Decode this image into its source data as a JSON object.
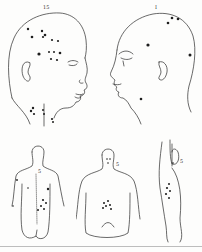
{
  "plate": {
    "title": "Anatomical illustration plate showing lesion distribution",
    "figures": [
      {
        "id": "head-right-profile",
        "label": "15",
        "view": "head, right lateral"
      },
      {
        "id": "head-left-profile",
        "label": "I",
        "view": "head, left lateral"
      },
      {
        "id": "torso-back",
        "label": "5",
        "view": "torso, posterior"
      },
      {
        "id": "torso-front",
        "label": "5",
        "view": "torso, anterior"
      },
      {
        "id": "torso-side",
        "label": "5",
        "view": "torso, lateral with arm raised"
      }
    ]
  },
  "colors": {
    "background": "#fdfdfc",
    "ink": "#2a2a2a",
    "rule": "#bdbdbd"
  }
}
